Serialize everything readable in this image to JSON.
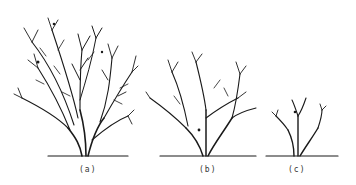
{
  "figure": {
    "ink_color": "#1a1a1a",
    "background": "#ffffff",
    "panels": [
      {
        "id": "a",
        "label": "(a)",
        "subject": "unpruned full shrub"
      },
      {
        "id": "b",
        "label": "(b)",
        "subject": "partially pruned shrub"
      },
      {
        "id": "c",
        "label": "(c)",
        "subject": "heavily pruned shrub"
      }
    ]
  }
}
